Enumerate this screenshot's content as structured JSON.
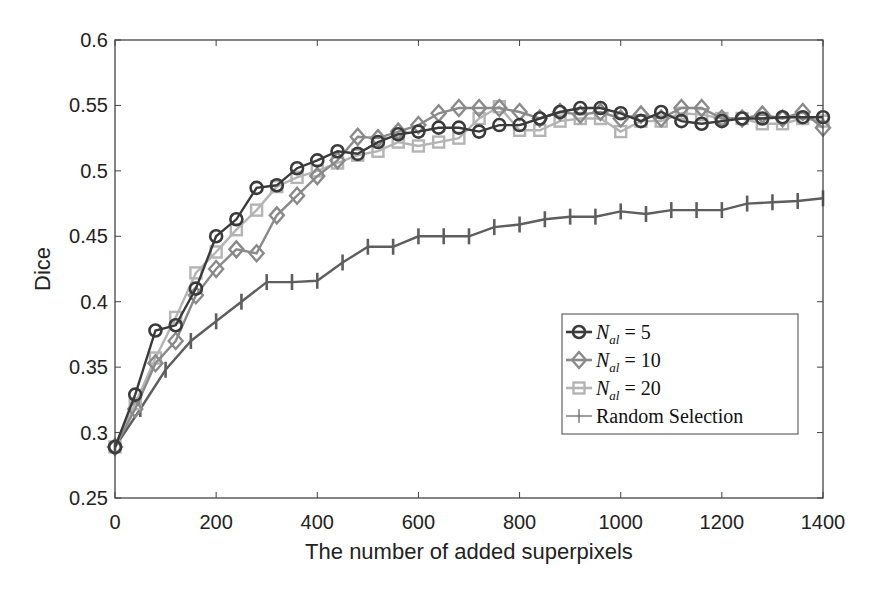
{
  "chart_data": {
    "type": "line",
    "title": "",
    "xlabel": "The number of added superpixels",
    "ylabel": "Dice",
    "xlim": [
      0,
      1400
    ],
    "ylim": [
      0.25,
      0.6
    ],
    "xticks": [
      0,
      200,
      400,
      600,
      800,
      1000,
      1200,
      1400
    ],
    "xtick_labels": [
      "0",
      "200",
      "400",
      "600",
      "800",
      "1000",
      "1200",
      "1400"
    ],
    "yticks": [
      0.25,
      0.3,
      0.35,
      0.4,
      0.45,
      0.5,
      0.55,
      0.6
    ],
    "ytick_labels": [
      "0.25",
      "0.3",
      "0.35",
      "0.4",
      "0.45",
      "0.5",
      "0.55",
      "0.6"
    ],
    "grid": false,
    "legend_position": "lower right (inside)",
    "series": [
      {
        "name": "N_al = 5",
        "legend_main": "N",
        "legend_sub": "al",
        "legend_rest": " = 5",
        "marker": "circle",
        "color": "#3a3a3a",
        "x": [
          0,
          40,
          80,
          120,
          160,
          200,
          240,
          280,
          320,
          360,
          400,
          440,
          480,
          520,
          560,
          600,
          640,
          680,
          720,
          760,
          800,
          840,
          880,
          920,
          960,
          1000,
          1040,
          1080,
          1120,
          1160,
          1200,
          1240,
          1280,
          1320,
          1360,
          1400
        ],
        "values": [
          0.289,
          0.329,
          0.378,
          0.382,
          0.41,
          0.45,
          0.463,
          0.487,
          0.489,
          0.502,
          0.508,
          0.515,
          0.513,
          0.522,
          0.528,
          0.53,
          0.533,
          0.533,
          0.53,
          0.535,
          0.535,
          0.54,
          0.545,
          0.548,
          0.548,
          0.544,
          0.538,
          0.545,
          0.538,
          0.536,
          0.538,
          0.54,
          0.54,
          0.541,
          0.541,
          0.541
        ]
      },
      {
        "name": "N_al = 10",
        "legend_main": "N",
        "legend_sub": "al",
        "legend_rest": " = 10",
        "marker": "diamond",
        "color": "#8a8a8a",
        "x": [
          0,
          40,
          80,
          120,
          160,
          200,
          240,
          280,
          320,
          360,
          400,
          440,
          480,
          520,
          560,
          600,
          640,
          680,
          720,
          760,
          800,
          840,
          880,
          920,
          960,
          1000,
          1040,
          1080,
          1120,
          1160,
          1200,
          1240,
          1280,
          1320,
          1360,
          1400
        ],
        "values": [
          0.289,
          0.318,
          0.353,
          0.37,
          0.405,
          0.425,
          0.44,
          0.437,
          0.466,
          0.481,
          0.496,
          0.508,
          0.526,
          0.525,
          0.53,
          0.535,
          0.544,
          0.548,
          0.548,
          0.548,
          0.545,
          0.54,
          0.545,
          0.543,
          0.545,
          0.54,
          0.543,
          0.54,
          0.548,
          0.548,
          0.54,
          0.54,
          0.543,
          0.54,
          0.545,
          0.533
        ]
      },
      {
        "name": "N_al = 20",
        "legend_main": "N",
        "legend_sub": "al",
        "legend_rest": " = 20",
        "marker": "square",
        "color": "#b4b4b4",
        "x": [
          0,
          40,
          80,
          120,
          160,
          200,
          240,
          280,
          320,
          360,
          400,
          440,
          480,
          520,
          560,
          600,
          640,
          680,
          720,
          760,
          800,
          840,
          880,
          920,
          960,
          1000,
          1040,
          1080,
          1120,
          1160,
          1200,
          1240,
          1280,
          1320,
          1360,
          1400
        ],
        "values": [
          0.289,
          0.322,
          0.357,
          0.388,
          0.422,
          0.438,
          0.455,
          0.47,
          0.488,
          0.495,
          0.5,
          0.506,
          0.512,
          0.515,
          0.522,
          0.519,
          0.522,
          0.525,
          0.54,
          0.549,
          0.531,
          0.531,
          0.538,
          0.54,
          0.54,
          0.53,
          0.538,
          0.538,
          0.544,
          0.543,
          0.54,
          0.54,
          0.536,
          0.536,
          0.54,
          0.538
        ]
      },
      {
        "name": "Random Selection",
        "legend_main": "Random Selection",
        "legend_sub": "",
        "legend_rest": "",
        "marker": "vertical-bar",
        "color": "#5e5e5e",
        "x": [
          0,
          50,
          100,
          150,
          200,
          250,
          300,
          350,
          400,
          450,
          500,
          550,
          600,
          650,
          700,
          750,
          800,
          850,
          900,
          950,
          1000,
          1050,
          1100,
          1150,
          1200,
          1250,
          1300,
          1350,
          1400
        ],
        "values": [
          0.289,
          0.318,
          0.348,
          0.37,
          0.385,
          0.4,
          0.415,
          0.415,
          0.416,
          0.43,
          0.442,
          0.442,
          0.45,
          0.45,
          0.45,
          0.457,
          0.459,
          0.463,
          0.465,
          0.465,
          0.469,
          0.467,
          0.47,
          0.47,
          0.47,
          0.475,
          0.476,
          0.477,
          0.479
        ]
      }
    ]
  }
}
